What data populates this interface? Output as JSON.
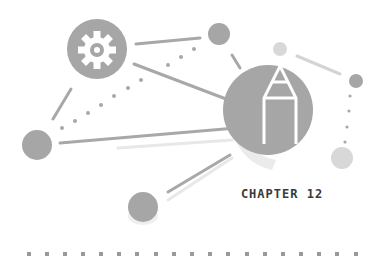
{
  "chapter": {
    "label": "CHAPTER 12"
  },
  "icons": {
    "gear": "gear-icon",
    "pencil": "pencil-icon"
  },
  "colors": {
    "node": "#a6a6a6",
    "node_light": "#d6d6d6",
    "line": "#a8a8a8",
    "line_light": "#e6e6e6",
    "text": "#3a3a3a",
    "dots": "#9a9a9a"
  }
}
